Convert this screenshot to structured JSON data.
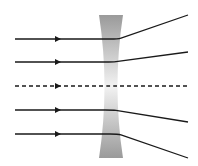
{
  "diagram": {
    "lens": {
      "type": "concave",
      "color_edge": "#9a9a9a",
      "color_center": "#efefef",
      "top_y": 15,
      "bottom_y": 158,
      "outer_left_x": 99,
      "outer_right_x": 123,
      "inner_left_x": 108,
      "inner_right_x": 114
    },
    "ray_color": "#1a1a1a",
    "rays": [
      {
        "id": "ray-1",
        "y": 39,
        "style": "solid",
        "bend_x": 118,
        "end_y": 15
      },
      {
        "id": "ray-2",
        "y": 62,
        "style": "solid",
        "bend_x": 113,
        "end_y": 52
      },
      {
        "id": "ray-axis",
        "y": 86,
        "style": "dashed",
        "bend_x": 111,
        "end_y": 86
      },
      {
        "id": "ray-4",
        "y": 110,
        "style": "solid",
        "bend_x": 113,
        "end_y": 122
      },
      {
        "id": "ray-5",
        "y": 134,
        "style": "solid",
        "bend_x": 118,
        "end_y": 158
      }
    ],
    "start_x": 15,
    "arrow_x": 58,
    "end_x": 188
  }
}
